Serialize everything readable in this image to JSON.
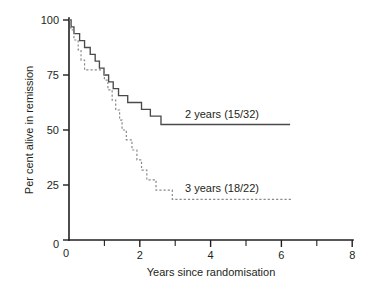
{
  "chart_data": {
    "type": "line",
    "title": "",
    "subtitle": "",
    "xlabel": "Years since randomisation",
    "ylabel": "Per cent alive in remission",
    "xlim": [
      0,
      8
    ],
    "ylim": [
      0,
      100
    ],
    "grid": false,
    "legend_position": "inline-annotation",
    "x_ticks_major": [
      0,
      2,
      4,
      6,
      8
    ],
    "x_ticks_minor": [
      1,
      3,
      5,
      7
    ],
    "x_tick_labels": [
      "0",
      "2",
      "4",
      "6",
      "8"
    ],
    "y_ticks_major": [
      0,
      25,
      50,
      75,
      100
    ],
    "y_tick_labels": [
      "0",
      "25",
      "50",
      "75",
      "100"
    ],
    "series": [
      {
        "name": "2 years (15/32)",
        "style": "solid",
        "color": "#4a4a4a",
        "annotation": "2 years (15/32)",
        "annotation_x": 3.3,
        "annotation_y": 57,
        "step": "post",
        "points": [
          [
            0.0,
            100.0
          ],
          [
            0.06,
            100.0
          ],
          [
            0.06,
            96.9
          ],
          [
            0.14,
            96.9
          ],
          [
            0.14,
            93.8
          ],
          [
            0.3,
            93.8
          ],
          [
            0.3,
            90.6
          ],
          [
            0.44,
            90.6
          ],
          [
            0.44,
            87.5
          ],
          [
            0.6,
            87.5
          ],
          [
            0.6,
            84.4
          ],
          [
            0.74,
            84.4
          ],
          [
            0.74,
            81.3
          ],
          [
            0.86,
            81.3
          ],
          [
            0.86,
            78.1
          ],
          [
            0.99,
            78.1
          ],
          [
            0.99,
            75.0
          ],
          [
            1.12,
            75.0
          ],
          [
            1.12,
            71.9
          ],
          [
            1.25,
            71.9
          ],
          [
            1.25,
            68.8
          ],
          [
            1.4,
            68.8
          ],
          [
            1.4,
            65.6
          ],
          [
            1.66,
            65.6
          ],
          [
            1.66,
            62.5
          ],
          [
            2.05,
            62.5
          ],
          [
            2.05,
            59.4
          ],
          [
            2.3,
            59.4
          ],
          [
            2.3,
            56.3
          ],
          [
            2.6,
            56.3
          ],
          [
            2.6,
            52.5
          ],
          [
            6.25,
            52.5
          ]
        ]
      },
      {
        "name": "3 years (18/22)",
        "style": "dashed",
        "color": "#8a8a8a",
        "annotation": "3 years (18/22)",
        "annotation_x": 3.3,
        "annotation_y": 22,
        "step": "post",
        "points": [
          [
            0.0,
            100.0
          ],
          [
            0.05,
            100.0
          ],
          [
            0.05,
            95.5
          ],
          [
            0.14,
            95.5
          ],
          [
            0.14,
            90.9
          ],
          [
            0.26,
            90.9
          ],
          [
            0.26,
            86.4
          ],
          [
            0.34,
            86.4
          ],
          [
            0.34,
            81.8
          ],
          [
            0.44,
            81.8
          ],
          [
            0.44,
            77.3
          ],
          [
            1.0,
            77.3
          ],
          [
            1.0,
            72.7
          ],
          [
            1.1,
            72.7
          ],
          [
            1.1,
            68.2
          ],
          [
            1.22,
            68.2
          ],
          [
            1.22,
            63.6
          ],
          [
            1.32,
            63.6
          ],
          [
            1.32,
            59.1
          ],
          [
            1.43,
            59.1
          ],
          [
            1.43,
            54.5
          ],
          [
            1.5,
            54.5
          ],
          [
            1.5,
            50.0
          ],
          [
            1.62,
            50.0
          ],
          [
            1.62,
            45.5
          ],
          [
            1.78,
            45.5
          ],
          [
            1.78,
            40.9
          ],
          [
            1.92,
            40.9
          ],
          [
            1.92,
            36.4
          ],
          [
            2.05,
            36.4
          ],
          [
            2.05,
            31.8
          ],
          [
            2.2,
            31.8
          ],
          [
            2.2,
            27.3
          ],
          [
            2.46,
            27.3
          ],
          [
            2.46,
            22.7
          ],
          [
            2.92,
            22.7
          ],
          [
            2.92,
            18.5
          ],
          [
            6.3,
            18.5
          ]
        ]
      }
    ]
  },
  "geometry": {
    "plot_left": 69,
    "plot_right": 352,
    "plot_top": 20,
    "plot_bottom": 240,
    "px_per_x": 35.4,
    "px_per_y": 2.2
  }
}
